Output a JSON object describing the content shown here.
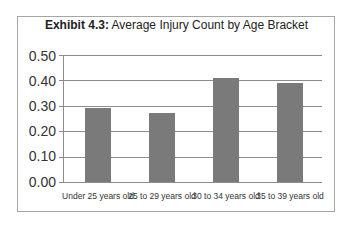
{
  "chart_data": {
    "type": "bar",
    "title_bold": "Exhibit 4.3:",
    "title_rest": " Average Injury Count by Age Bracket",
    "title": "Exhibit 4.3: Average Injury Count by Age Bracket",
    "categories": [
      "Under 25 years old",
      "25 to 29 years old",
      "30 to 34 years old",
      "35 to 39 years old"
    ],
    "values": [
      0.29,
      0.27,
      0.41,
      0.39
    ],
    "xlabel": "",
    "ylabel": "",
    "ylim": [
      0,
      0.5
    ],
    "yticks": [
      "0.50",
      "0.40",
      "0.30",
      "0.20",
      "0.10",
      "0.00"
    ],
    "grid": true,
    "legend": "none",
    "bar_color": "#7a7a7a"
  }
}
